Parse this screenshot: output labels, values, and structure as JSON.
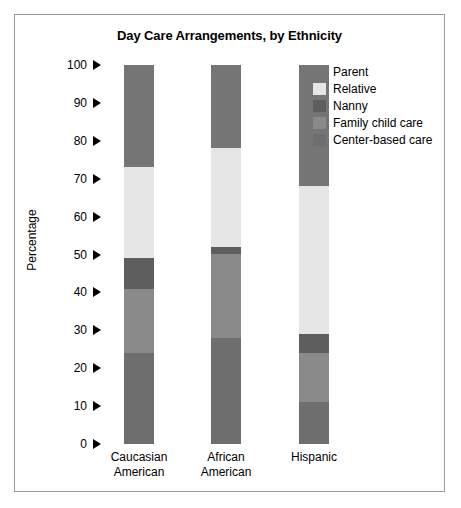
{
  "chart_data": {
    "type": "bar",
    "subtype": "stacked-bar",
    "title": "Day Care Arrangements, by Ethnicity",
    "xlabel": "",
    "ylabel": "Percentage",
    "ylim": [
      0,
      100
    ],
    "ytick_step": 10,
    "yticks": [
      100,
      90,
      80,
      70,
      60,
      50,
      40,
      30,
      20,
      10,
      0
    ],
    "ytick_labels": [
      "100",
      "90",
      "80",
      "70",
      "60",
      "50",
      "40",
      "30",
      "20",
      "10",
      "0"
    ],
    "grid": false,
    "legend_position": "top-right",
    "categories": [
      "Caucasian American",
      "African American",
      "Hispanic"
    ],
    "category_lines": [
      [
        "Caucasian",
        "American"
      ],
      [
        "African",
        "American"
      ],
      [
        "Hispanic"
      ]
    ],
    "stack_order_bottom_to_top": [
      "Center-based care",
      "Family child care",
      "Nanny",
      "Relative",
      "Parent"
    ],
    "series": [
      {
        "name": "Parent",
        "color": "#757575",
        "values": [
          27,
          22,
          32
        ]
      },
      {
        "name": "Relative",
        "color": "#e6e6e6",
        "values": [
          24,
          26,
          39
        ]
      },
      {
        "name": "Nanny",
        "color": "#5e5e5e",
        "values": [
          8,
          2,
          5
        ]
      },
      {
        "name": "Family child care",
        "color": "#8a8a8a",
        "values": [
          17,
          22,
          13
        ]
      },
      {
        "name": "Center-based care",
        "color": "#6e6e6e",
        "values": [
          24,
          28,
          11
        ]
      }
    ],
    "cumulative_tops": {
      "Caucasian American": {
        "Center-based care": 24,
        "Family child care": 41,
        "Nanny": 49,
        "Relative": 73,
        "Parent": 100
      },
      "African American": {
        "Center-based care": 28,
        "Family child care": 50,
        "Nanny": 52,
        "Relative": 78,
        "Parent": 100
      },
      "Hispanic": {
        "Center-based care": 11,
        "Family child care": 33,
        "Nanny": 29,
        "Relative": 68,
        "Parent": 100
      }
    }
  },
  "legend": {
    "items": [
      {
        "label": "Parent",
        "color": "#757575"
      },
      {
        "label": "Relative",
        "color": "#e6e6e6"
      },
      {
        "label": "Nanny",
        "color": "#5e5e5e"
      },
      {
        "label": "Family child care",
        "color": "#8a8a8a"
      },
      {
        "label": "Center-based care",
        "color": "#6e6e6e"
      }
    ]
  },
  "colors": {
    "frame_border": "#9a9a9a",
    "background": "#ffffff",
    "text": "#000000"
  }
}
